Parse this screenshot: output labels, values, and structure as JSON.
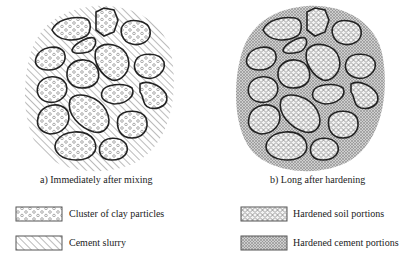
{
  "panels": [
    {
      "id": "a",
      "caption": "a) Immediately after mixing",
      "matrix": "Cement slurry",
      "particles": "Cluster of clay particles"
    },
    {
      "id": "b",
      "caption": "b) Long after hardening",
      "matrix": "Hardened cement portions",
      "particles": "Hardened soil portions"
    }
  ],
  "legend": [
    {
      "label": "Cluster of clay particles",
      "pattern": "open-circles"
    },
    {
      "label": "Cement slurry",
      "pattern": "diagonal-hatch"
    },
    {
      "label": "Hardened soil portions",
      "pattern": "hexagonal-mesh"
    },
    {
      "label": "Hardened cement portions",
      "pattern": "fine-crosshatch"
    }
  ]
}
